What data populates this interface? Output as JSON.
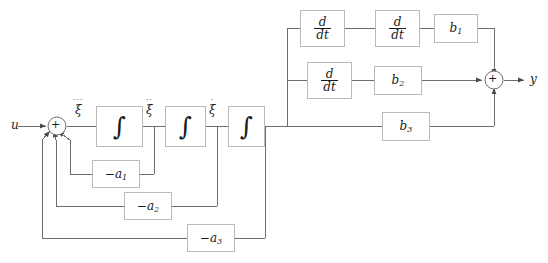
{
  "diagram": {
    "background": "#ffffff",
    "line_color": "#6e6e6e",
    "box_border_color": "#b9b9b9",
    "text_color": "#1a1a1a",
    "signals": {
      "input": "u",
      "output": "y",
      "state_3rd": "ξ",
      "state_2nd": "ξ",
      "state_1st": "ξ",
      "dots_3rd": "···",
      "dots_2nd": "··",
      "dots_1st": "·"
    },
    "summers": {
      "input_sign": "+",
      "output_sign": "+"
    },
    "integrators": [
      {
        "symbol": "∫",
        "name": "integrator-1"
      },
      {
        "symbol": "∫",
        "name": "integrator-2"
      },
      {
        "symbol": "∫",
        "name": "integrator-3"
      }
    ],
    "derivatives": [
      {
        "num": "d",
        "den": "dt",
        "name": "derivative-1"
      },
      {
        "num": "d",
        "den": "dt",
        "name": "derivative-2"
      },
      {
        "num": "d",
        "den": "dt",
        "name": "derivative-3"
      }
    ],
    "feedback_gains": [
      {
        "base": "−a",
        "index": "1"
      },
      {
        "base": "−a",
        "index": "2"
      },
      {
        "base": "−a",
        "index": "3"
      }
    ],
    "forward_gains": [
      {
        "base": "b",
        "index": "1"
      },
      {
        "base": "b",
        "index": "2"
      },
      {
        "base": "b",
        "index": "3"
      }
    ]
  }
}
